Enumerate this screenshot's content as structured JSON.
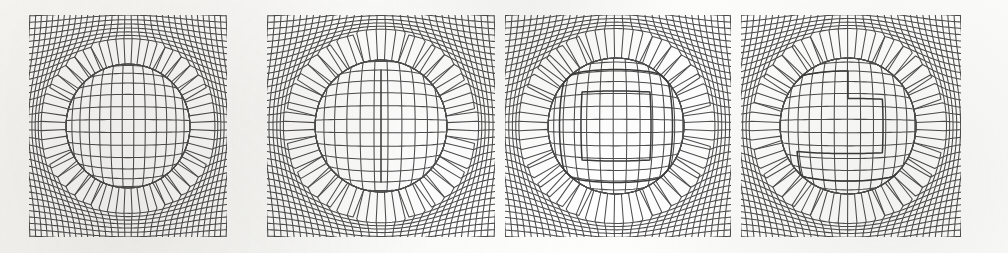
{
  "figure": {
    "panel_count": 4,
    "background_color": "#fdfdfc",
    "mesh_color": "#4e4e4e",
    "shape_color": "#3a3a3a",
    "media": "grayscale scanned figure"
  },
  "chart_data": {
    "type": "diagram",
    "xlabel": "",
    "ylabel": "",
    "grid": true,
    "legend_position": "none",
    "panels": [
      {
        "index": 1,
        "label": "a",
        "frame": {
          "x": 30,
          "y": 16,
          "width": 196,
          "height": 220
        },
        "grid": {
          "cols": 33,
          "rows": 33,
          "cell_px": 6
        },
        "lens": {
          "cx": 128,
          "cy": 126,
          "radius": 62,
          "magnification": 1.95,
          "falloff": 1.0
        },
        "embedded_shape": {
          "kind": "none",
          "points": []
        }
      },
      {
        "index": 2,
        "label": "b",
        "frame": {
          "x": 268,
          "y": 16,
          "width": 226,
          "height": 220
        },
        "grid": {
          "cols": 33,
          "rows": 33,
          "cell_px": 6
        },
        "lens": {
          "cx": 381,
          "cy": 126,
          "radius": 66,
          "magnification": 2.05,
          "falloff": 1.0
        },
        "embedded_shape": {
          "kind": "vertical-slot",
          "points": [
            [
              381,
              96
            ],
            [
              381,
              156
            ]
          ]
        }
      },
      {
        "index": 3,
        "label": "c",
        "frame": {
          "x": 506,
          "y": 16,
          "width": 224,
          "height": 220
        },
        "grid": {
          "cols": 33,
          "rows": 33,
          "cell_px": 6
        },
        "lens": {
          "cx": 616,
          "cy": 126,
          "radius": 68,
          "magnification": 2.0,
          "falloff": 1.0
        },
        "embedded_shape": {
          "kind": "concentric-squares",
          "squares": [
            {
              "cx": 616,
              "cy": 126,
              "half": 18
            },
            {
              "cx": 616,
              "cy": 126,
              "half": 31
            }
          ]
        }
      },
      {
        "index": 4,
        "label": "d",
        "frame": {
          "x": 742,
          "y": 16,
          "width": 218,
          "height": 220
        },
        "grid": {
          "cols": 33,
          "rows": 33,
          "cell_px": 6
        },
        "lens": {
          "cx": 848,
          "cy": 126,
          "radius": 68,
          "magnification": 2.0,
          "falloff": 1.0
        },
        "embedded_shape": {
          "kind": "spiral-path",
          "points": [
            [
              818,
              96
            ],
            [
              848,
              96
            ],
            [
              848,
              112
            ],
            [
              866,
              112
            ],
            [
              866,
              140
            ],
            [
              820,
              140
            ],
            [
              820,
              156
            ],
            [
              878,
              156
            ]
          ]
        }
      }
    ]
  }
}
